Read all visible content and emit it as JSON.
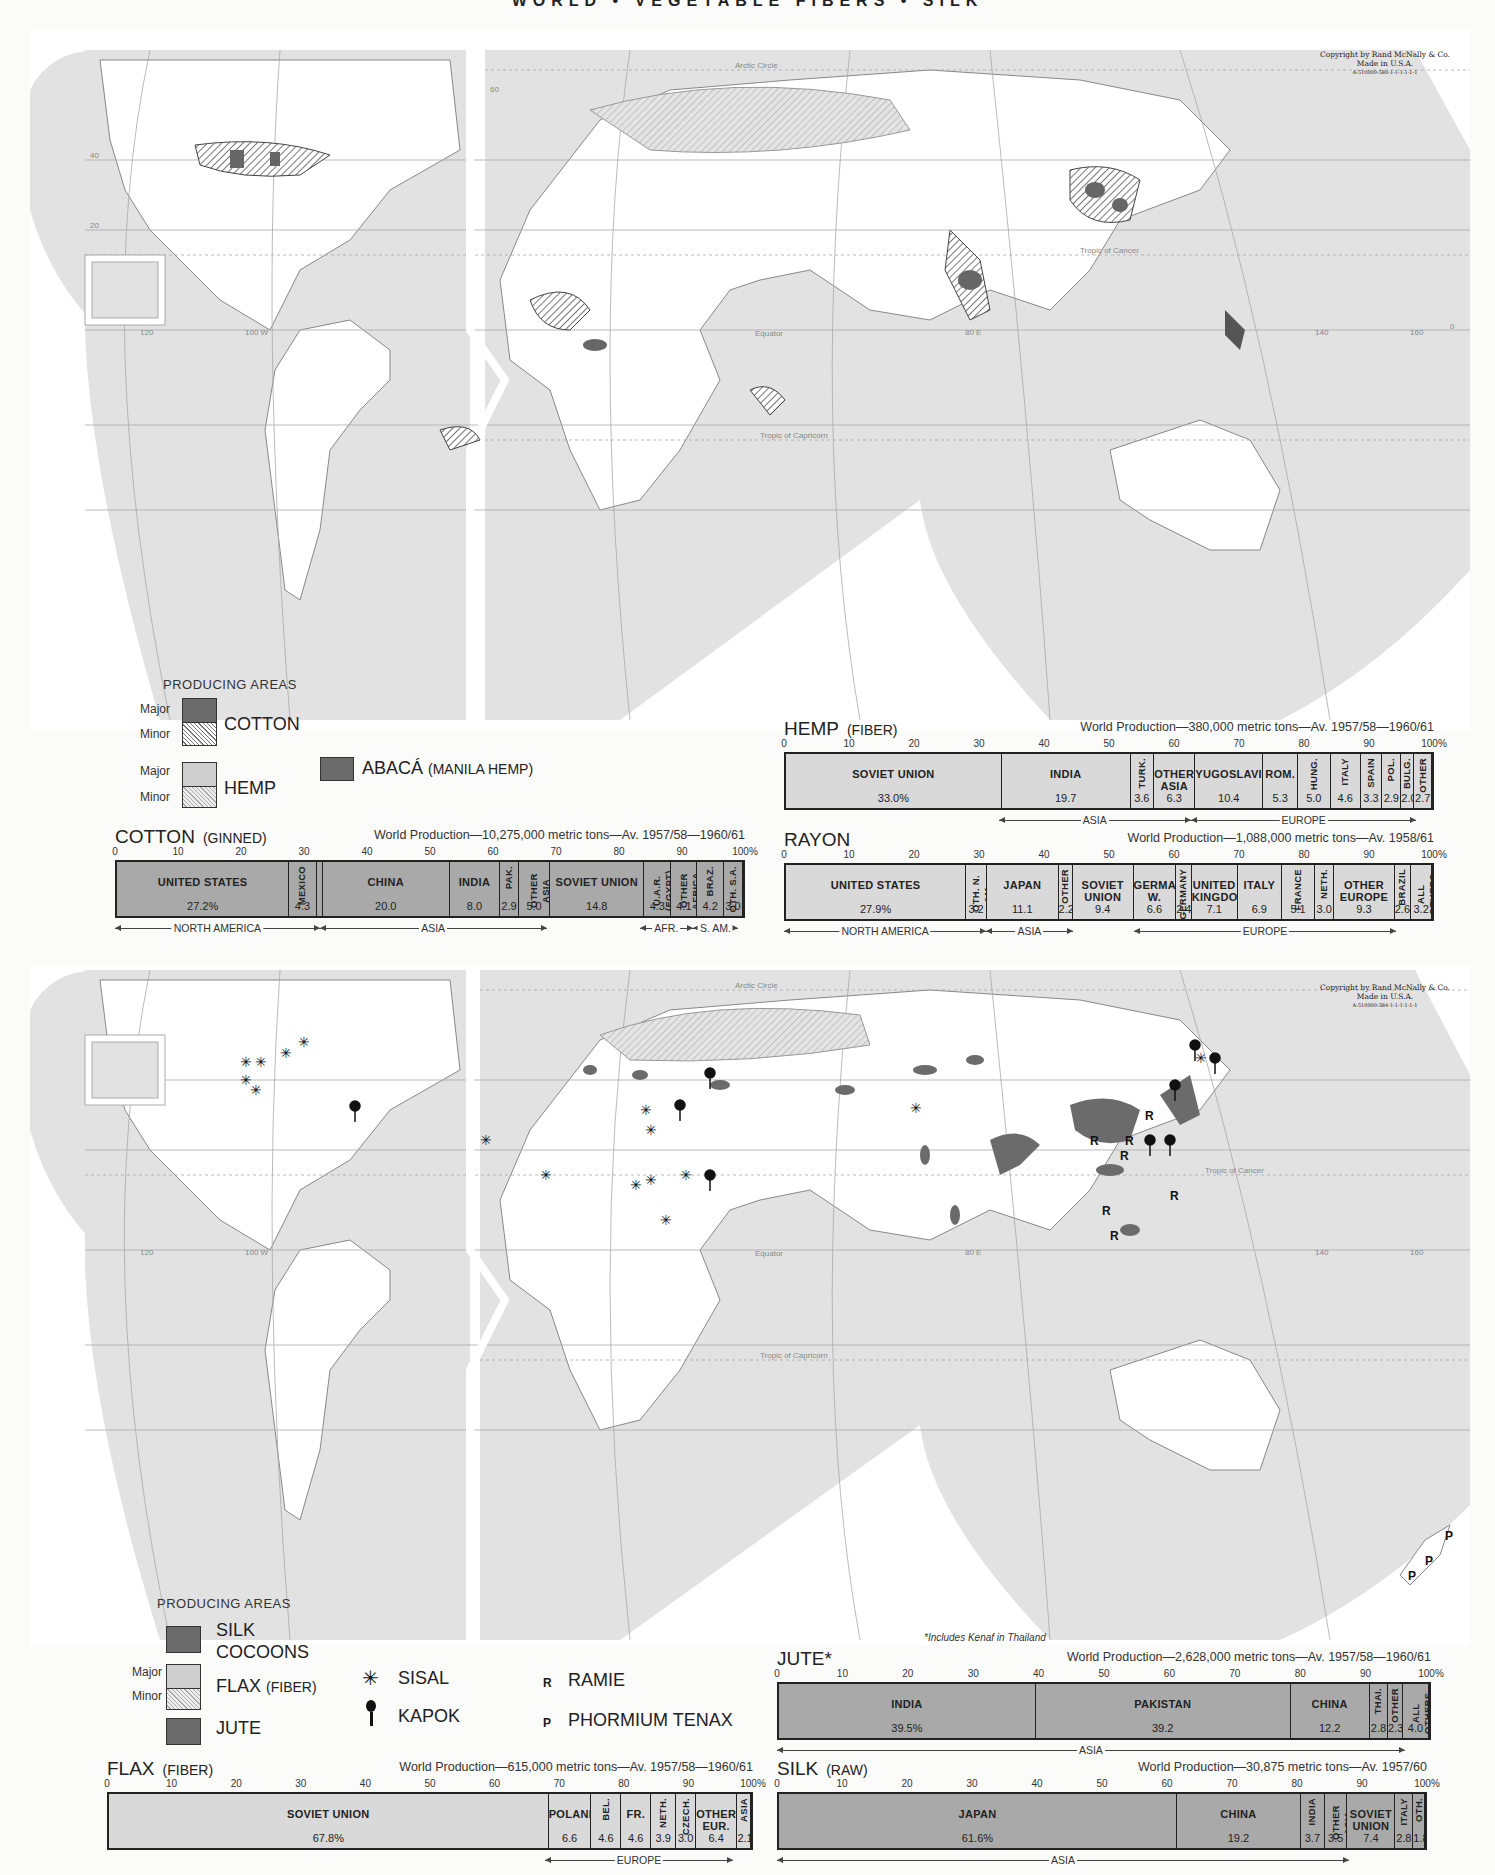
{
  "page": {
    "title": "WORLD • VEGETABLE FIBERS • SILK"
  },
  "maps": {
    "top": {
      "copyright_line1": "Copyright by Rand McNally & Co.",
      "copyright_line2": "Made in U.S.A.",
      "copyright_code": "A-510000-580-1-1-1-1-1-1",
      "labels": {
        "arctic_circle": "Arctic Circle",
        "tropic_cancer": "Tropic of Cancer",
        "equator": "Equator",
        "tropic_capricorn": "Tropic of Capricorn",
        "lon_100w": "100 W",
        "lon_120": "120",
        "lon_80e": "80 E",
        "lon_140": "140",
        "lon_160": "160",
        "lat_60": "60",
        "lat_40": "40",
        "lat_20": "20",
        "lat_0": "0"
      },
      "legend": {
        "heading": "PRODUCING AREAS",
        "major": "Major",
        "minor": "Minor",
        "cotton": "COTTON",
        "hemp": "HEMP",
        "abaca": "ABACÁ",
        "abaca_sub": "(MANILA HEMP)"
      }
    },
    "bottom": {
      "copyright_line1": "Copyright by Rand McNally & Co.",
      "copyright_line2": "Made in U.S.A.",
      "copyright_code": "A-510000-384-1-1-1-1-1-1",
      "labels": {
        "arctic_circle": "Arctic Circle",
        "tropic_cancer": "Tropic of Cancer",
        "equator": "Equator",
        "tropic_capricorn": "Tropic of Capricorn",
        "lon_100w": "100 W",
        "lon_120": "120",
        "lon_80e": "80 E",
        "lon_140": "140",
        "lon_160": "160"
      },
      "legend": {
        "heading": "PRODUCING AREAS",
        "major": "Major",
        "minor": "Minor",
        "silk": "SILK",
        "silk2": "COCOONS",
        "flax": "FLAX",
        "flax_sub": "(FIBER)",
        "jute": "JUTE",
        "sisal": "SISAL",
        "kapok": "KAPOK",
        "ramie": "RAMIE",
        "ramie_symbol": "R",
        "phormium": "PHORMIUM TENAX",
        "phormium_symbol": "P"
      },
      "footnote": "*Includes Kenaf in Thailand"
    }
  },
  "chart_data": [
    {
      "type": "bar",
      "subtype": "stacked-100-percent",
      "title": "COTTON",
      "subtitle": "(GINNED)",
      "production": "World Production—10,275,000 metric tons—Av. 1957/58—1960/61",
      "xlim": [
        0,
        100
      ],
      "ticks": [
        "0",
        "10",
        "20",
        "30",
        "40",
        "50",
        "60",
        "70",
        "80",
        "90",
        "100%"
      ],
      "categories": [
        "UNITED STATES",
        "MEXICO",
        "",
        "CHINA",
        "INDIA",
        "PAK.",
        "OTHER ASIA",
        "SOVIET UNION",
        "U.A.R. (EGYPT)",
        "OTHER AFRICA",
        "BRAZ.",
        "OTH. S.A."
      ],
      "values": [
        27.2,
        4.3,
        1.0,
        20.0,
        8.0,
        2.9,
        5.0,
        14.8,
        4.3,
        4.1,
        4.2,
        3.0
      ],
      "value_labels": [
        "27.2%",
        "4.3",
        "",
        "20.0",
        "8.0",
        "2.9",
        "5.0",
        "14.8",
        "4.3",
        "4.1",
        "4.2",
        "3.0"
      ],
      "regions": [
        {
          "label": "NORTH AMERICA",
          "start": 0,
          "end": 32.5
        },
        {
          "label": "ASIA",
          "start": 32.5,
          "end": 68.5
        },
        {
          "label": "AFR.",
          "start": 83.3,
          "end": 91.7
        },
        {
          "label": "S. AM.",
          "start": 91.7,
          "end": 98.9
        }
      ]
    },
    {
      "type": "bar",
      "subtype": "stacked-100-percent",
      "title": "HEMP",
      "subtitle": "(FIBER)",
      "production": "World Production—380,000 metric tons—Av. 1957/58—1960/61",
      "xlim": [
        0,
        100
      ],
      "ticks": [
        "0",
        "10",
        "20",
        "30",
        "40",
        "50",
        "60",
        "70",
        "80",
        "90",
        "100%"
      ],
      "categories": [
        "SOVIET UNION",
        "INDIA",
        "TURK.",
        "OTHER ASIA",
        "YUGOSLAVIA",
        "ROM.",
        "HUNG.",
        "ITALY",
        "SPAIN",
        "POL.",
        "BULG.",
        "OTHER"
      ],
      "values": [
        33.0,
        19.7,
        3.6,
        6.3,
        10.4,
        5.3,
        5.0,
        4.6,
        3.3,
        2.9,
        2.0,
        2.7
      ],
      "value_labels": [
        "33.0%",
        "19.7",
        "3.6",
        "6.3",
        "10.4",
        "5.3",
        "5.0",
        "4.6",
        "3.3",
        "2.9",
        "2.0",
        "2.7"
      ],
      "regions": [
        {
          "label": "ASIA",
          "start": 33.0,
          "end": 62.6
        },
        {
          "label": "EUROPE",
          "start": 62.6,
          "end": 97.3
        }
      ]
    },
    {
      "type": "bar",
      "subtype": "stacked-100-percent",
      "title": "RAYON",
      "subtitle": "",
      "production": "World Production—1,088,000 metric tons—Av. 1958/61",
      "xlim": [
        0,
        100
      ],
      "ticks": [
        "0",
        "10",
        "20",
        "30",
        "40",
        "50",
        "60",
        "70",
        "80",
        "90",
        "100%"
      ],
      "categories": [
        "UNITED STATES",
        "OTH. N. AM.",
        "JAPAN",
        "OTHER",
        "SOVIET UNION",
        "GERMANY W.",
        "GERMANY E.",
        "UNITED KINGDOM",
        "ITALY",
        "FRANCE",
        "NETH.",
        "OTHER EUROPE",
        "BRAZIL",
        "ALL OTHERS"
      ],
      "values": [
        27.9,
        3.2,
        11.1,
        2.2,
        9.4,
        6.6,
        2.4,
        7.1,
        6.9,
        5.1,
        3.0,
        9.3,
        2.6,
        3.2
      ],
      "value_labels": [
        "27.9%",
        "3.2",
        "11.1",
        "2.2",
        "9.4",
        "6.6",
        "2.4",
        "7.1",
        "6.9",
        "5.1",
        "3.0",
        "9.3",
        "2.6",
        "3.2"
      ],
      "regions": [
        {
          "label": "NORTH AMERICA",
          "start": 0,
          "end": 31.1
        },
        {
          "label": "ASIA",
          "start": 31.1,
          "end": 44.4
        },
        {
          "label": "EUROPE",
          "start": 53.8,
          "end": 94.2
        }
      ]
    },
    {
      "type": "bar",
      "subtype": "stacked-100-percent",
      "title": "FLAX",
      "subtitle": "(FIBER)",
      "production": "World Production—615,000 metric tons—Av. 1957/58—1960/61",
      "xlim": [
        0,
        100
      ],
      "ticks": [
        "0",
        "10",
        "20",
        "30",
        "40",
        "50",
        "60",
        "70",
        "80",
        "90",
        "100%"
      ],
      "categories": [
        "SOVIET UNION",
        "POLAND",
        "BEL.",
        "FR.",
        "NETH.",
        "CZECH.",
        "OTHER EUR.",
        "ASIA"
      ],
      "values": [
        67.8,
        6.6,
        4.6,
        4.6,
        3.9,
        3.0,
        6.4,
        2.1
      ],
      "value_labels": [
        "67.8%",
        "6.6",
        "4.6",
        "4.6",
        "3.9",
        "3.0",
        "6.4",
        "2.1"
      ],
      "regions": [
        {
          "label": "EUROPE",
          "start": 67.8,
          "end": 96.9
        }
      ]
    },
    {
      "type": "bar",
      "subtype": "stacked-100-percent",
      "title": "JUTE*",
      "subtitle": "",
      "production": "World Production—2,628,000 metric tons—Av. 1957/58—1960/61",
      "xlim": [
        0,
        100
      ],
      "ticks": [
        "0",
        "10",
        "20",
        "30",
        "40",
        "50",
        "60",
        "70",
        "80",
        "90",
        "100%"
      ],
      "categories": [
        "INDIA",
        "PAKISTAN",
        "CHINA",
        "THAI.",
        "OTHER",
        "ALL OTHERS"
      ],
      "values": [
        39.5,
        39.2,
        12.2,
        2.8,
        2.3,
        4.0
      ],
      "value_labels": [
        "39.5%",
        "39.2",
        "12.2",
        "2.8",
        "2.3",
        "4.0"
      ],
      "regions": [
        {
          "label": "ASIA",
          "start": 0,
          "end": 96.0
        }
      ]
    },
    {
      "type": "bar",
      "subtype": "stacked-100-percent",
      "title": "SILK",
      "subtitle": "(RAW)",
      "production": "World Production—30,875 metric tons—Av. 1957/60",
      "xlim": [
        0,
        100
      ],
      "ticks": [
        "0",
        "10",
        "20",
        "30",
        "40",
        "50",
        "60",
        "70",
        "80",
        "90",
        "100%"
      ],
      "categories": [
        "JAPAN",
        "CHINA",
        "INDIA",
        "OTHER ASIA",
        "SOVIET UNION",
        "ITALY",
        "OTH."
      ],
      "values": [
        61.6,
        19.2,
        3.7,
        3.5,
        7.4,
        2.8,
        1.8
      ],
      "value_labels": [
        "61.6%",
        "19.2",
        "3.7",
        "3.5",
        "7.4",
        "2.8",
        "1.8"
      ],
      "regions": [
        {
          "label": "ASIA",
          "start": 0,
          "end": 88.0
        }
      ]
    }
  ]
}
